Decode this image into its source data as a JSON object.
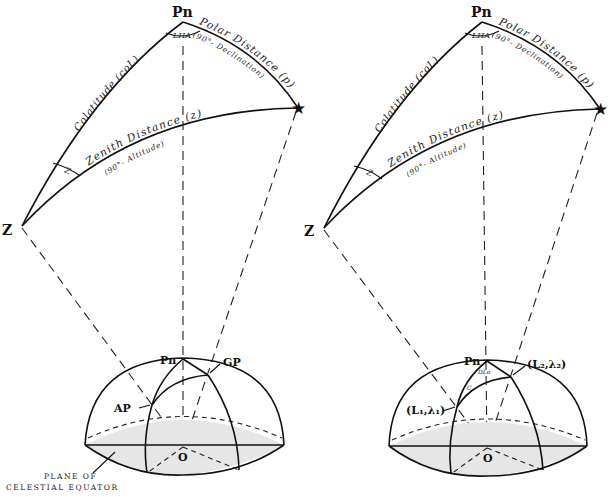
{
  "figure": {
    "left_panel": {
      "vertices": {
        "pole": "Pn",
        "zenith": "Z",
        "body_icon": "star"
      },
      "angle_labels": {
        "meridian_angle": "LHA",
        "azimuth_angle": "Z"
      },
      "side_labels": {
        "colatitude": "Colatitude (coL)",
        "polar_distance": "Polar Distance (p)",
        "polar_distance_sub": "(90°- Declination)",
        "zenith_distance": "Zenith Distance (z)",
        "zenith_distance_sub": "(90°- Altitude)"
      },
      "hemisphere": {
        "pole": "Pn",
        "point_gp": "GP",
        "point_ap": "AP",
        "center": "O",
        "plane_caption_line1": "PLANE OF",
        "plane_caption_line2": "CELESTIAL EQUATOR"
      }
    },
    "right_panel": {
      "vertices": {
        "pole": "Pn",
        "zenith": "Z",
        "body_icon": "star"
      },
      "angle_labels": {
        "meridian_angle": "LHA",
        "azimuth_angle": "Z"
      },
      "side_labels": {
        "colatitude": "Colatitude (coL)",
        "polar_distance": "Polar Distance (p)",
        "polar_distance_sub": "(90°- Declination)",
        "zenith_distance": "Zenith Distance (z)",
        "zenith_distance_sub": "(90°- Altitude)"
      },
      "hemisphere": {
        "pole": "Pn",
        "point_2": "(L₂,λ₂)",
        "point_1": "(L₁,λ₁)",
        "center": "O",
        "dlo_label": "DLo",
        "course_label": "C"
      }
    }
  }
}
